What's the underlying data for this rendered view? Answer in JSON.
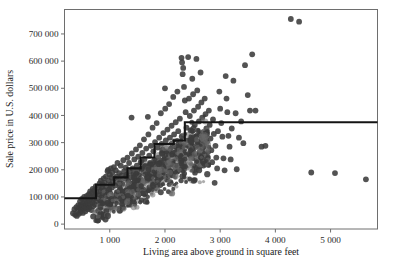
{
  "chart_data": {
    "type": "scatter",
    "title": "",
    "xlabel": "Living area above ground in square feet",
    "ylabel": "Sale price in U.S. dollars",
    "xlim": [
      180,
      5850
    ],
    "ylim": [
      -18000,
      790000
    ],
    "grid": false,
    "legend": "none",
    "x_ticks": [
      1000,
      2000,
      3000,
      4000,
      5000
    ],
    "x_tick_labels": [
      "1 000",
      "2 000",
      "3 000",
      "4 000",
      "5 000"
    ],
    "y_ticks": [
      0,
      100000,
      200000,
      300000,
      400000,
      500000,
      600000,
      700000
    ],
    "y_tick_labels": [
      "0",
      "100 000",
      "200 000",
      "300 000",
      "400 000",
      "500 000",
      "600 000",
      "700 000"
    ],
    "point_color": "#3b3b3b",
    "line_color": "#141414",
    "frame_color": "#6e6e6e",
    "series": [
      {
        "name": "Houses",
        "marker": "filled-circle",
        "points": [
          [
            334,
            40000
          ],
          [
            360,
            55000
          ],
          [
            372,
            34000
          ],
          [
            395,
            62000
          ],
          [
            404,
            30000
          ],
          [
            420,
            50000
          ],
          [
            430,
            70000
          ],
          [
            441,
            38000
          ],
          [
            455,
            60000
          ],
          [
            462,
            84000
          ],
          [
            470,
            45000
          ],
          [
            478,
            72000
          ],
          [
            488,
            55000
          ],
          [
            496,
            93000
          ],
          [
            505,
            65000
          ],
          [
            512,
            41000
          ],
          [
            520,
            78000
          ],
          [
            529,
            58000
          ],
          [
            536,
            100000
          ],
          [
            544,
            68000
          ],
          [
            552,
            88000
          ],
          [
            560,
            47000
          ],
          [
            568,
            75000
          ],
          [
            576,
            62000
          ],
          [
            584,
            104000
          ],
          [
            592,
            82000
          ],
          [
            600,
            55000
          ],
          [
            607,
            95000
          ],
          [
            615,
            70000
          ],
          [
            622,
            110000
          ],
          [
            630,
            60000
          ],
          [
            638,
            88000
          ],
          [
            645,
            120000
          ],
          [
            652,
            74000
          ],
          [
            660,
            98000
          ],
          [
            668,
            52000
          ],
          [
            676,
            115000
          ],
          [
            684,
            80000
          ],
          [
            692,
            130000
          ],
          [
            700,
            66000
          ],
          [
            708,
            104000
          ],
          [
            716,
            92000
          ],
          [
            724,
            125000
          ],
          [
            732,
            72000
          ],
          [
            740,
            110000
          ],
          [
            748,
            140000
          ],
          [
            756,
            85000
          ],
          [
            764,
            118000
          ],
          [
            772,
            96000
          ],
          [
            780,
            13000
          ],
          [
            790,
            14000
          ],
          [
            800,
            135000
          ],
          [
            808,
            105000
          ],
          [
            816,
            150000
          ],
          [
            824,
            88000
          ],
          [
            832,
            122000
          ],
          [
            840,
            160000
          ],
          [
            848,
            98000
          ],
          [
            856,
            132000
          ],
          [
            864,
            112000
          ],
          [
            872,
            145000
          ],
          [
            880,
            90000
          ],
          [
            890,
            168000
          ],
          [
            900,
            125000
          ],
          [
            910,
            152000
          ],
          [
            920,
            108000
          ],
          [
            930,
            175000
          ],
          [
            940,
            138000
          ],
          [
            950,
            118000
          ],
          [
            960,
            195000
          ],
          [
            970,
            200000
          ],
          [
            980,
            160000
          ],
          [
            990,
            128000
          ],
          [
            1000,
            182000
          ],
          [
            1010,
            145000
          ],
          [
            1020,
            205000
          ],
          [
            1030,
            172000
          ],
          [
            1040,
            135000
          ],
          [
            1050,
            190000
          ],
          [
            1060,
            155000
          ],
          [
            1075,
            210000
          ],
          [
            1090,
            168000
          ],
          [
            1100,
            142000
          ],
          [
            1110,
            198000
          ],
          [
            1125,
            175000
          ],
          [
            1140,
            225000
          ],
          [
            1155,
            150000
          ],
          [
            1170,
            188000
          ],
          [
            1185,
            162000
          ],
          [
            1200,
            215000
          ],
          [
            1215,
            178000
          ],
          [
            1230,
            148000
          ],
          [
            1245,
            235000
          ],
          [
            1260,
            195000
          ],
          [
            1275,
            168000
          ],
          [
            1290,
            208000
          ],
          [
            1305,
            182000
          ],
          [
            1320,
            245000
          ],
          [
            1335,
            158000
          ],
          [
            1350,
            225000
          ],
          [
            1365,
            192000
          ],
          [
            1380,
            172000
          ],
          [
            1395,
            392000
          ],
          [
            1400,
            260000
          ],
          [
            1415,
            205000
          ],
          [
            1430,
            185000
          ],
          [
            1445,
            238000
          ],
          [
            1460,
            168000
          ],
          [
            1475,
            275000
          ],
          [
            1490,
            215000
          ],
          [
            1500,
            195000
          ],
          [
            1515,
            248000
          ],
          [
            1530,
            178000
          ],
          [
            1545,
            290000
          ],
          [
            1560,
            228000
          ],
          [
            1575,
            205000
          ],
          [
            1590,
            262000
          ],
          [
            1605,
            188000
          ],
          [
            1620,
            312000
          ],
          [
            1630,
            240000
          ],
          [
            1645,
            215000
          ],
          [
            1660,
            278000
          ],
          [
            1675,
            198000
          ],
          [
            1690,
            395000
          ],
          [
            1700,
            330000
          ],
          [
            1715,
            252000
          ],
          [
            1730,
            225000
          ],
          [
            1745,
            288000
          ],
          [
            1760,
            208000
          ],
          [
            1775,
            355000
          ],
          [
            1790,
            268000
          ],
          [
            1805,
            235000
          ],
          [
            1820,
            302000
          ],
          [
            1835,
            218000
          ],
          [
            1850,
            372000
          ],
          [
            1865,
            282000
          ],
          [
            1880,
            245000
          ],
          [
            1895,
            318000
          ],
          [
            1910,
            228000
          ],
          [
            1925,
            408000
          ],
          [
            1940,
            295000
          ],
          [
            1955,
            258000
          ],
          [
            1970,
            335000
          ],
          [
            1985,
            238000
          ],
          [
            2000,
            500000
          ],
          [
            2005,
            425000
          ],
          [
            2015,
            308000
          ],
          [
            2030,
            268000
          ],
          [
            2045,
            348000
          ],
          [
            2060,
            248000
          ],
          [
            2075,
            442000
          ],
          [
            2090,
            318000
          ],
          [
            2105,
            278000
          ],
          [
            2120,
            362000
          ],
          [
            2135,
            258000
          ],
          [
            2150,
            468000
          ],
          [
            2165,
            330000
          ],
          [
            2180,
            288000
          ],
          [
            2195,
            375000
          ],
          [
            2210,
            268000
          ],
          [
            2225,
            488000
          ],
          [
            2240,
            342000
          ],
          [
            2255,
            298000
          ],
          [
            2270,
            388000
          ],
          [
            2285,
            278000
          ],
          [
            2300,
            612000
          ],
          [
            2310,
            595000
          ],
          [
            2320,
            552000
          ],
          [
            2330,
            575000
          ],
          [
            2345,
            505000
          ],
          [
            2360,
            455000
          ],
          [
            2375,
            412000
          ],
          [
            2390,
            355000
          ],
          [
            2405,
            308000
          ],
          [
            2420,
            615000
          ],
          [
            2435,
            462000
          ],
          [
            2450,
            398000
          ],
          [
            2465,
            345000
          ],
          [
            2480,
            298000
          ],
          [
            2495,
            535000
          ],
          [
            2510,
            478000
          ],
          [
            2525,
            418000
          ],
          [
            2540,
            365000
          ],
          [
            2555,
            318000
          ],
          [
            2570,
            608000
          ],
          [
            2585,
            492000
          ],
          [
            2600,
            432000
          ],
          [
            2615,
            378000
          ],
          [
            2630,
            328000
          ],
          [
            2645,
            558000
          ],
          [
            2660,
            448000
          ],
          [
            2675,
            392000
          ],
          [
            2690,
            338000
          ],
          [
            2705,
            292000
          ],
          [
            2720,
            462000
          ],
          [
            2735,
            405000
          ],
          [
            2750,
            352000
          ],
          [
            2765,
            305000
          ],
          [
            2780,
            265000
          ],
          [
            2795,
            418000
          ],
          [
            2810,
            365000
          ],
          [
            2825,
            315000
          ],
          [
            2840,
            272000
          ],
          [
            2855,
            228000
          ],
          [
            2870,
            385000
          ],
          [
            2885,
            332000
          ],
          [
            2900,
            152000
          ],
          [
            2915,
            288000
          ],
          [
            2930,
            245000
          ],
          [
            2945,
            205000
          ],
          [
            2960,
            342000
          ],
          [
            2985,
            488000
          ],
          [
            3000,
            425000
          ],
          [
            3020,
            372000
          ],
          [
            3040,
            322000
          ],
          [
            3060,
            242000
          ],
          [
            3080,
            198000
          ],
          [
            3100,
            545000
          ],
          [
            3115,
            462000
          ],
          [
            3130,
            412000
          ],
          [
            3150,
            325000
          ],
          [
            3170,
            285000
          ],
          [
            3190,
            238000
          ],
          [
            3210,
            352000
          ],
          [
            3240,
            528000
          ],
          [
            3280,
            408000
          ],
          [
            3300,
            202000
          ],
          [
            3340,
            318000
          ],
          [
            3380,
            378000
          ],
          [
            3420,
            298000
          ],
          [
            3450,
            585000
          ],
          [
            3500,
            475000
          ],
          [
            3540,
            418000
          ],
          [
            3580,
            625000
          ],
          [
            3640,
            418000
          ],
          [
            3750,
            285000
          ],
          [
            3820,
            288000
          ],
          [
            4280,
            755000
          ],
          [
            4430,
            745000
          ],
          [
            4650,
            190000
          ],
          [
            5080,
            188000
          ],
          [
            5640,
            165000
          ]
        ]
      }
    ],
    "step_line": {
      "name": "Regression tree step fit",
      "style": "solid-black",
      "steps": [
        [
          180,
          95000
        ],
        [
          750,
          95000
        ],
        [
          750,
          145000
        ],
        [
          1080,
          145000
        ],
        [
          1080,
          172000
        ],
        [
          1320,
          172000
        ],
        [
          1320,
          205000
        ],
        [
          1560,
          205000
        ],
        [
          1560,
          245000
        ],
        [
          1810,
          245000
        ],
        [
          1810,
          295000
        ],
        [
          2160,
          295000
        ],
        [
          2160,
          308000
        ],
        [
          2360,
          308000
        ],
        [
          2360,
          375000
        ],
        [
          5850,
          375000
        ]
      ]
    }
  }
}
